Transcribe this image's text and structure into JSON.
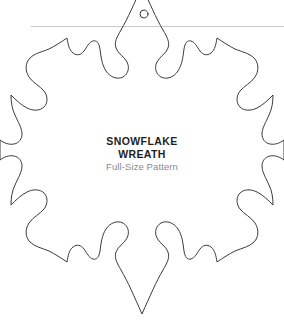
{
  "page": {
    "width": 284,
    "height": 322,
    "background_color": "#ffffff"
  },
  "body_copy": {
    "line1": "f",
    "line2": "retty",
    "line3": "g and",
    "color": "#2b2b2b"
  },
  "divider": {
    "name": "horizontal-rule",
    "color": "#c9c9c9"
  },
  "pattern": {
    "name": "snowflake-wreath-pattern",
    "stroke_color": "#3a3a3a",
    "fill_color": "none",
    "points": 6,
    "hanging_hole": {
      "name": "hanging-hole",
      "cx": 144,
      "cy": 14,
      "r": 4
    }
  },
  "caption": {
    "title_line_1": "SNOWFLAKE",
    "title_line_2": "WREATH",
    "subtitle": "Full-Size Pattern",
    "title_color": "#1e1e1e",
    "subtitle_color": "#8a8a8a"
  }
}
